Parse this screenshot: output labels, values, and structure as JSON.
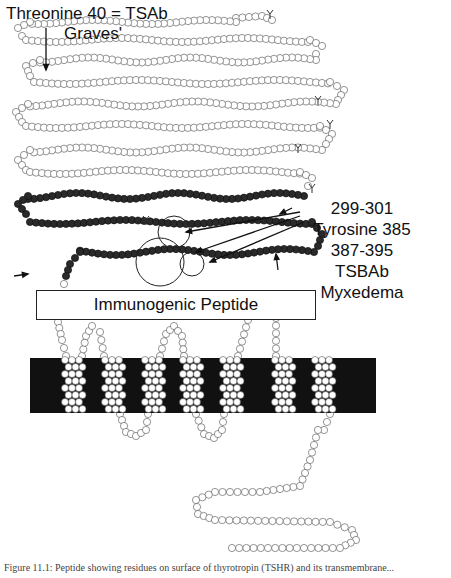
{
  "figure": {
    "labels": {
      "top_line1": "Threonine 40 = TSAb",
      "top_line2": "Graves'",
      "right_lines": [
        "299-301",
        "Tyrosine 385",
        "387-395",
        "TSBAb",
        "Myxedema"
      ],
      "peptide_box": "Immunogenic Peptide"
    },
    "caption": "Figure 11.1: Peptide showing residues on surface of thyrotropin (TSHR) and its transmembrane..."
  },
  "colors": {
    "open_residue": "#ffffff",
    "filled_residue": "#2a2a2a",
    "membrane_band": "#111111",
    "outline": "#333333"
  }
}
